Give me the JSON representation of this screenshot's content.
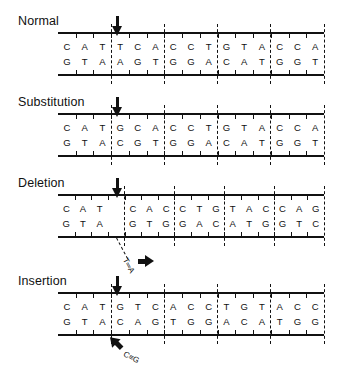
{
  "figure": {
    "colors": {
      "ink": "#111111",
      "background": "#ffffff"
    }
  },
  "panels": [
    {
      "id": "normal",
      "label": "Normal",
      "arrow": {
        "name": "mutation-site-arrow",
        "glyph": "down-arrow",
        "column": 3
      },
      "top_strand": [
        "C",
        "A",
        "T",
        "T",
        "C",
        "A",
        "C",
        "C",
        "T",
        "G",
        "T",
        "A",
        "C",
        "C",
        "A"
      ],
      "bottom_strand": [
        "G",
        "T",
        "A",
        "A",
        "G",
        "T",
        "G",
        "G",
        "A",
        "C",
        "A",
        "T",
        "G",
        "G",
        "T"
      ],
      "codon_starts": [
        0,
        3,
        6,
        9,
        12
      ],
      "gaps": [],
      "callout": null
    },
    {
      "id": "substitution",
      "label": "Substitution",
      "arrow": {
        "name": "mutation-site-arrow",
        "glyph": "down-arrow",
        "column": 3
      },
      "top_strand": [
        "C",
        "A",
        "T",
        "G",
        "C",
        "A",
        "C",
        "C",
        "T",
        "G",
        "T",
        "A",
        "C",
        "C",
        "A"
      ],
      "bottom_strand": [
        "G",
        "T",
        "A",
        "C",
        "G",
        "T",
        "G",
        "G",
        "A",
        "C",
        "A",
        "T",
        "G",
        "G",
        "T"
      ],
      "codon_starts": [
        0,
        3,
        6,
        9,
        12
      ],
      "gaps": [],
      "callout": null
    },
    {
      "id": "deletion",
      "label": "Deletion",
      "arrow": {
        "name": "mutation-site-arrow",
        "glyph": "down-arrow",
        "column": 3
      },
      "top_strand": [
        "C",
        "A",
        "T",
        "",
        "C",
        "A",
        "C",
        "C",
        "T",
        "G",
        "T",
        "A",
        "C",
        "C",
        "A",
        "G"
      ],
      "bottom_strand": [
        "G",
        "T",
        "A",
        "",
        "G",
        "T",
        "G",
        "G",
        "A",
        "C",
        "A",
        "T",
        "G",
        "G",
        "T",
        "C"
      ],
      "codon_starts": [
        0,
        4,
        7,
        10,
        13
      ],
      "gaps": [
        3
      ],
      "callout": {
        "name": "removed-base-pair-callout",
        "pair_label": "T═A",
        "arrow_direction": "right",
        "leader_from_column": 3
      }
    },
    {
      "id": "insertion",
      "label": "Insertion",
      "arrow": {
        "name": "mutation-site-arrow",
        "glyph": "down-arrow",
        "column": 3
      },
      "top_strand": [
        "C",
        "A",
        "T",
        "G",
        "T",
        "C",
        "A",
        "C",
        "C",
        "T",
        "G",
        "T",
        "A",
        "C",
        "C"
      ],
      "bottom_strand": [
        "G",
        "T",
        "A",
        "C",
        "A",
        "G",
        "T",
        "G",
        "G",
        "A",
        "C",
        "A",
        "T",
        "G",
        "G"
      ],
      "codon_starts": [
        0,
        3,
        6,
        9,
        12
      ],
      "gaps": [],
      "callout": {
        "name": "inserted-base-pair-callout",
        "pair_label": "C≡G",
        "arrow_direction": "up-left",
        "leader_from_column": 3
      }
    }
  ]
}
